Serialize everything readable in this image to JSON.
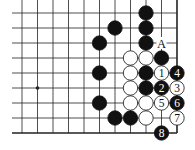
{
  "diagram": {
    "type": "go-board-fragment",
    "grid": {
      "columns_x": [
        22,
        37.5,
        53,
        68.5,
        84,
        99.5,
        115,
        130.5,
        146,
        161.5,
        177
      ],
      "rows_y": [
        13,
        28,
        43,
        58,
        73,
        88,
        103,
        118,
        133
      ],
      "left_x": 12,
      "top_y": 0,
      "right_edge": true,
      "bottom_edge": true
    },
    "star_points": [
      {
        "col": 1,
        "row": 5
      }
    ],
    "stones": [
      {
        "col": 8,
        "row": 0,
        "color": "black"
      },
      {
        "col": 6,
        "row": 1,
        "color": "black"
      },
      {
        "col": 8,
        "row": 1,
        "color": "black"
      },
      {
        "col": 5,
        "row": 2,
        "color": "black"
      },
      {
        "col": 8,
        "row": 2,
        "color": "black"
      },
      {
        "col": 7,
        "row": 3,
        "color": "white"
      },
      {
        "col": 8,
        "row": 3,
        "color": "white"
      },
      {
        "col": 9,
        "row": 3,
        "color": "black"
      },
      {
        "col": 5,
        "row": 4,
        "color": "black"
      },
      {
        "col": 7,
        "row": 4,
        "color": "white"
      },
      {
        "col": 8,
        "row": 4,
        "color": "black"
      },
      {
        "col": 9,
        "row": 4,
        "color": "white",
        "label": "1"
      },
      {
        "col": 10,
        "row": 4,
        "color": "black",
        "label": "4"
      },
      {
        "col": 7,
        "row": 5,
        "color": "white"
      },
      {
        "col": 8,
        "row": 5,
        "color": "black"
      },
      {
        "col": 9,
        "row": 5,
        "color": "black",
        "label": "2"
      },
      {
        "col": 10,
        "row": 5,
        "color": "white",
        "label": "3"
      },
      {
        "col": 5,
        "row": 6,
        "color": "black"
      },
      {
        "col": 7,
        "row": 6,
        "color": "white"
      },
      {
        "col": 8,
        "row": 6,
        "color": "white"
      },
      {
        "col": 9,
        "row": 6,
        "color": "white",
        "label": "5"
      },
      {
        "col": 10,
        "row": 6,
        "color": "black",
        "label": "6"
      },
      {
        "col": 6,
        "row": 7,
        "color": "black"
      },
      {
        "col": 7,
        "row": 7,
        "color": "black"
      },
      {
        "col": 8,
        "row": 7,
        "color": "white"
      },
      {
        "col": 10,
        "row": 7,
        "color": "white",
        "label": "7"
      },
      {
        "col": 9,
        "row": 8,
        "color": "black",
        "label": "8"
      }
    ],
    "markers": [
      {
        "col": 9,
        "row": 2,
        "text": "A"
      }
    ],
    "colors": {
      "line": "#222222",
      "black_stone": "#111111",
      "white_stone": "#ffffff",
      "background": "#ffffff"
    }
  }
}
